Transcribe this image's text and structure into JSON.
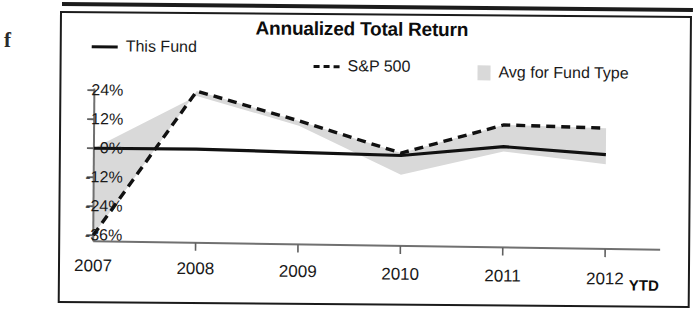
{
  "scan": {
    "bleed_glyph": "f"
  },
  "chart": {
    "title": "Annualized Total Return",
    "axis_note": "YTD",
    "legend": [
      {
        "label": "This Fund",
        "swatch": "solid-line-swatch",
        "color": "#111111"
      },
      {
        "label": "S&P 500",
        "swatch": "dashed-line-swatch",
        "color": "#111111"
      },
      {
        "label": "Avg for Fund Type",
        "swatch": "filled-area-swatch",
        "color": "#d9d9d9"
      }
    ]
  },
  "chart_data": {
    "type": "line",
    "title": "Annualized Total Return",
    "xlabel": "",
    "ylabel": "",
    "categories": [
      "2007",
      "2008",
      "2009",
      "2010",
      "2011",
      "2012"
    ],
    "x_tick_labels": [
      "2007",
      "2008",
      "2009",
      "2010",
      "2011",
      "2012"
    ],
    "x_axis_note": "YTD",
    "y_tick_labels": [
      "24%",
      "12%",
      "0%",
      "-12%",
      "-24%",
      "-36%"
    ],
    "y_ticks": [
      24,
      12,
      0,
      -12,
      -24,
      -36
    ],
    "ylim": [
      -40,
      28
    ],
    "grid": false,
    "legend_position": "top",
    "series": [
      {
        "name": "This Fund",
        "style": "solid",
        "color": "#111111",
        "values": [
          0,
          0,
          -1,
          -2,
          2,
          -1
        ]
      },
      {
        "name": "S&P 500",
        "style": "dashed",
        "color": "#111111",
        "values": [
          -36,
          24,
          12,
          -1,
          11,
          10
        ]
      },
      {
        "name": "Avg for Fund Type",
        "style": "filled-area",
        "color": "#d9d9d9",
        "values": [
          0,
          22,
          10,
          -10,
          0,
          -5
        ]
      }
    ]
  }
}
